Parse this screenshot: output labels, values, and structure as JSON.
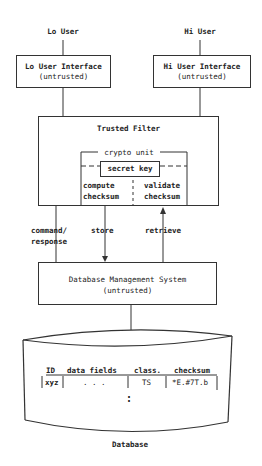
{
  "users": {
    "lo": "Lo User",
    "hi": "Hi User"
  },
  "lo_interface": {
    "title": "Lo User Interface",
    "subtitle": "(untrusted)"
  },
  "hi_interface": {
    "title": "Hi User Interface",
    "subtitle": "(untrusted)"
  },
  "trusted_filter": {
    "title": "Trusted Filter",
    "crypto_unit": {
      "label": "crypto unit",
      "secret_key": "secret key",
      "compute": [
        "compute",
        "checksum"
      ],
      "validate": [
        "validate",
        "checksum"
      ]
    }
  },
  "flows": {
    "command": [
      "command/",
      "response"
    ],
    "store": "store",
    "retrieve": "retrieve"
  },
  "dbms": {
    "title": "Database Management System",
    "subtitle": "(untrusted)"
  },
  "database": {
    "label": "Database",
    "columns": [
      "ID",
      "data fields",
      "class.",
      "checksum"
    ],
    "row": [
      "xyz",
      ". . .",
      "TS",
      "*E.#7T.b"
    ],
    "continuation": ":"
  }
}
